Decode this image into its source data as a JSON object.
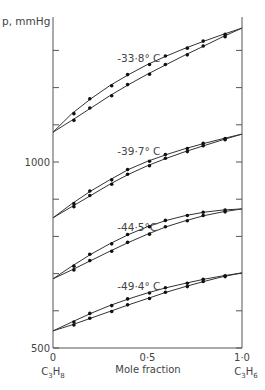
{
  "chart_data": {
    "type": "line",
    "title": "",
    "ylabel": "p, mmHg",
    "xlabel": "Mole fraction",
    "x_left_label": "C3H8",
    "x_right_label": "C3H6",
    "xlim": [
      0,
      1.0
    ],
    "ylim": [
      500,
      1400
    ],
    "x_ticks": [
      {
        "v": 0,
        "label": "0"
      },
      {
        "v": 0.5,
        "label": "0·5"
      },
      {
        "v": 1.0,
        "label": "1·0"
      }
    ],
    "y_ticks": [
      {
        "v": 500,
        "label": "500"
      },
      {
        "v": 600,
        "label": ""
      },
      {
        "v": 700,
        "label": ""
      },
      {
        "v": 800,
        "label": ""
      },
      {
        "v": 900,
        "label": ""
      },
      {
        "v": 1000,
        "label": "1000"
      },
      {
        "v": 1100,
        "label": ""
      },
      {
        "v": 1200,
        "label": ""
      },
      {
        "v": 1300,
        "label": ""
      }
    ],
    "grid": false,
    "series": [
      {
        "name": "-33·8° C",
        "label_pos": [
          0.34,
          1270
        ],
        "upper": {
          "x": [
            0,
            0.1,
            0.2,
            0.3,
            0.4,
            0.5,
            0.6,
            0.7,
            0.8,
            0.9,
            1.0
          ],
          "y": [
            1080,
            1130,
            1170,
            1205,
            1235,
            1262,
            1285,
            1306,
            1325,
            1343,
            1360
          ]
        },
        "lower": {
          "x": [
            0,
            0.1,
            0.2,
            0.3,
            0.4,
            0.5,
            0.6,
            0.7,
            0.8,
            0.9,
            1.0
          ],
          "y": [
            1080,
            1112,
            1145,
            1178,
            1208,
            1236,
            1262,
            1288,
            1312,
            1337,
            1360
          ]
        }
      },
      {
        "name": "-39·7° C",
        "label_pos": [
          0.34,
          1020
        ],
        "upper": {
          "x": [
            0,
            0.1,
            0.2,
            0.3,
            0.4,
            0.5,
            0.6,
            0.7,
            0.8,
            0.9,
            1.0
          ],
          "y": [
            850,
            888,
            922,
            952,
            980,
            1002,
            1020,
            1036,
            1050,
            1063,
            1075
          ]
        },
        "lower": {
          "x": [
            0,
            0.1,
            0.2,
            0.3,
            0.4,
            0.5,
            0.6,
            0.7,
            0.8,
            0.9,
            1.0
          ],
          "y": [
            850,
            880,
            910,
            940,
            967,
            990,
            1010,
            1028,
            1044,
            1060,
            1075
          ]
        }
      },
      {
        "name": "-44·5°C",
        "label_pos": [
          0.34,
          815
        ],
        "upper": {
          "x": [
            0,
            0.1,
            0.2,
            0.3,
            0.4,
            0.5,
            0.6,
            0.7,
            0.8,
            0.9,
            1.0
          ],
          "y": [
            686,
            720,
            752,
            780,
            805,
            826,
            843,
            856,
            865,
            871,
            874
          ]
        },
        "lower": {
          "x": [
            0,
            0.1,
            0.2,
            0.3,
            0.4,
            0.5,
            0.6,
            0.7,
            0.8,
            0.9,
            1.0
          ],
          "y": [
            686,
            710,
            735,
            760,
            784,
            806,
            826,
            842,
            856,
            866,
            874
          ]
        }
      },
      {
        "name": "-49·4° C",
        "label_pos": [
          0.34,
          655
        ],
        "upper": {
          "x": [
            0,
            0.1,
            0.2,
            0.3,
            0.4,
            0.5,
            0.6,
            0.7,
            0.8,
            0.9,
            1.0
          ],
          "y": [
            546,
            570,
            593,
            614,
            632,
            648,
            662,
            674,
            685,
            694,
            702
          ]
        },
        "lower": {
          "x": [
            0,
            0.1,
            0.2,
            0.3,
            0.4,
            0.5,
            0.6,
            0.7,
            0.8,
            0.9,
            1.0
          ],
          "y": [
            546,
            562,
            580,
            598,
            616,
            633,
            650,
            665,
            679,
            692,
            702
          ]
        }
      }
    ]
  }
}
